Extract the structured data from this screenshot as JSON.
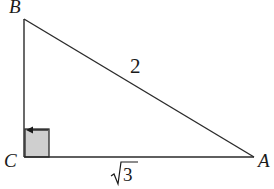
{
  "diagram": {
    "type": "right-triangle",
    "vertices": {
      "B": {
        "label": "B",
        "x": 24,
        "y": 19
      },
      "C": {
        "label": "C",
        "x": 24,
        "y": 157
      },
      "A": {
        "label": "A",
        "x": 254,
        "y": 157
      }
    },
    "sides": {
      "hypotenuse": {
        "from": "B",
        "to": "A",
        "label": "2"
      },
      "base": {
        "from": "C",
        "to": "A",
        "label": "√3",
        "radicand": "3"
      },
      "vertical": {
        "from": "B",
        "to": "C",
        "label": ""
      }
    },
    "right_angle_at": "C",
    "colors": {
      "stroke": "#2a2a2a",
      "right_angle_fill": "#cfcfcf",
      "text": "#1a1a1a"
    }
  }
}
